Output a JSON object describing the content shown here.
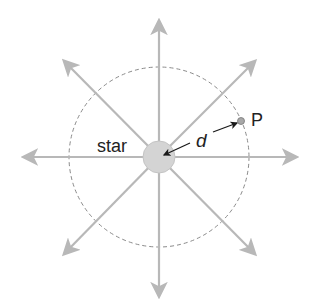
{
  "diagram": {
    "title": "",
    "labels": {
      "star": "star",
      "distance": "d",
      "point": "P"
    },
    "colors": {
      "rays": "#b8b8b8",
      "star_fill": "#d4d4d4",
      "star_stroke": "#c4c4c4",
      "circle": "#8a8a8a",
      "arrow": "#1a1a1a",
      "point_fill": "#a8a8a8",
      "text": "#222222"
    },
    "geometry": {
      "center": [
        159,
        157
      ],
      "star_radius": 16,
      "sphere_radius": 90,
      "ray_count": 8,
      "point_P": [
        241,
        121
      ]
    }
  }
}
